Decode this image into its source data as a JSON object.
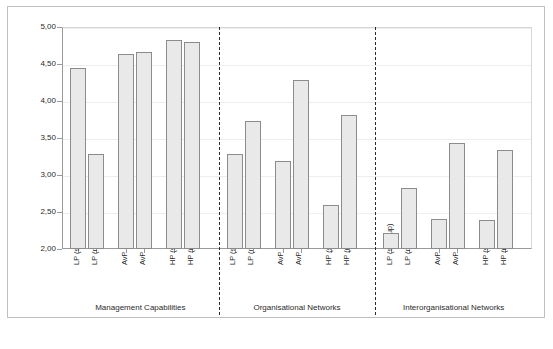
{
  "chart_data": {
    "type": "bar",
    "title": "",
    "subtitle": "",
    "xlabel": "",
    "ylabel": "",
    "ylim": [
      2.0,
      5.0
    ],
    "ytick_labels": [
      "2,00",
      "2,50",
      "3,00",
      "3,50",
      "4,00",
      "4,50",
      "5,00"
    ],
    "ytick_values": [
      2.0,
      2.5,
      3.0,
      3.5,
      4.0,
      4.5,
      5.0
    ],
    "grid": true,
    "legend": "none",
    "decimal_separator": ",",
    "categories": [
      "LP (start-up)",
      "LP (mature)",
      "AvP (start-up)",
      "AvP (mature)",
      "HP (start-up)",
      "HP (mature)"
    ],
    "groups": [
      {
        "label": "Management Capabilities",
        "values": [
          4.44,
          3.28,
          4.63,
          4.66,
          4.83,
          4.8
        ]
      },
      {
        "label": "Organisational Networks",
        "values": [
          3.28,
          3.73,
          3.19,
          4.28,
          2.59,
          3.81
        ]
      },
      {
        "label": "Interorganisational Networks",
        "values": [
          2.21,
          2.82,
          2.41,
          3.43,
          2.39,
          3.34
        ]
      }
    ],
    "colors": {
      "bar_fill": "#e9e9e9",
      "bar_border": "#8c8c8c",
      "axis": "#9a9a9a",
      "grid": "#eeeeee",
      "separator": "#2b2b2b",
      "text": "#2b2b2b",
      "frame": "#bfbfbf",
      "background": "#ffffff"
    }
  }
}
